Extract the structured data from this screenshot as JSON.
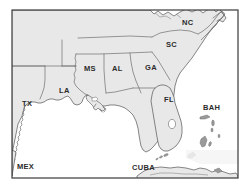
{
  "figure": {
    "kind": "reference-map",
    "region_title": "Southeastern United States, Gulf of Mexico and Caribbean",
    "width": 239,
    "height": 195
  },
  "colors": {
    "land_fill": "#e8e8e8",
    "water_fill": "#ffffff",
    "coastline_stroke": "#555555",
    "state_border_stroke": "#6e6e6e",
    "frame_stroke": "#3a3a3a",
    "label_text": "#2b2b2b",
    "page_background": "#ffffff"
  },
  "frame": {
    "x": 12,
    "y": 10,
    "width": 226,
    "height": 168
  },
  "labels": {
    "states": [
      {
        "code": "TX",
        "name": "Texas",
        "x": 27,
        "y": 104
      },
      {
        "code": "LA",
        "name": "Louisiana",
        "x": 64,
        "y": 91
      },
      {
        "code": "MS",
        "name": "Mississippi",
        "x": 89,
        "y": 69
      },
      {
        "code": "AL",
        "name": "Alabama",
        "x": 117,
        "y": 69
      },
      {
        "code": "GA",
        "name": "Georgia",
        "x": 150,
        "y": 68
      },
      {
        "code": "FL",
        "name": "Florida",
        "x": 168,
        "y": 100
      },
      {
        "code": "SC",
        "name": "South Carolina",
        "x": 170,
        "y": 45
      },
      {
        "code": "NC",
        "name": "North Carolina",
        "x": 186,
        "y": 23
      }
    ],
    "other_regions": [
      {
        "code": "MEX",
        "name": "Mexico",
        "x": 23,
        "y": 167
      },
      {
        "code": "CUBA",
        "name": "Cuba",
        "x": 141,
        "y": 168
      },
      {
        "code": "BAH",
        "name": "Bahamas",
        "x": 208,
        "y": 108
      }
    ]
  },
  "features": [
    {
      "name": "gulf-of-mexico",
      "type": "water"
    },
    {
      "name": "atlantic-ocean",
      "type": "water"
    },
    {
      "name": "florida-peninsula",
      "type": "land"
    },
    {
      "name": "lake-okeechobee",
      "type": "water"
    },
    {
      "name": "florida-keys",
      "type": "land"
    },
    {
      "name": "mississippi-delta",
      "type": "land"
    },
    {
      "name": "bahamas-islands",
      "type": "land"
    },
    {
      "name": "cuba-island",
      "type": "land"
    }
  ]
}
